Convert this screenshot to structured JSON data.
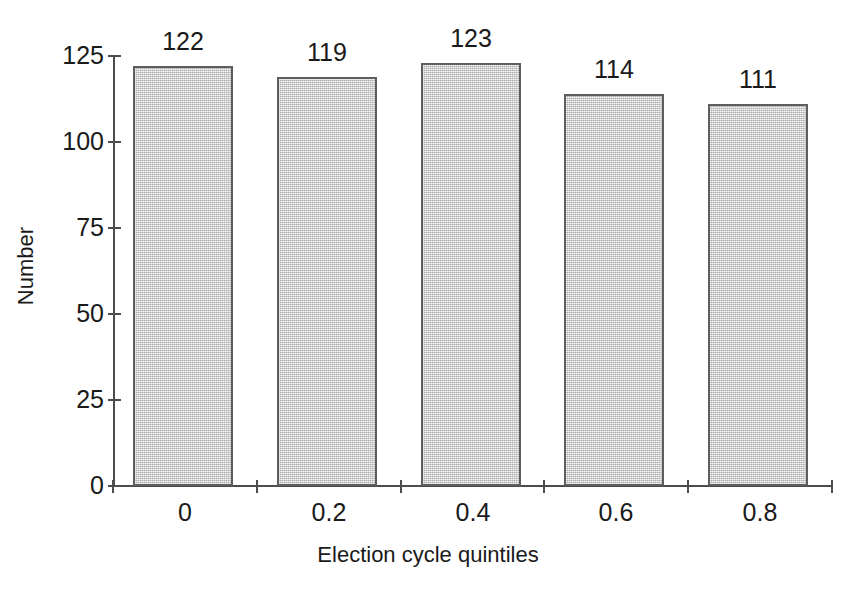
{
  "chart_data": {
    "type": "bar",
    "title": "",
    "subtitle": "",
    "xlabel": "Election cycle quintiles",
    "ylabel": "Number",
    "categories": [
      "0",
      "0.2",
      "0.4",
      "0.6",
      "0.8"
    ],
    "values": [
      122,
      119,
      123,
      114,
      111
    ],
    "data_labels": [
      "122",
      "119",
      "123",
      "114",
      "111"
    ],
    "ylim": [
      0,
      125
    ],
    "y_ticks": [
      0,
      25,
      50,
      75,
      100,
      125
    ],
    "y_tick_labels": [
      "0",
      "25",
      "50",
      "75",
      "100",
      "125"
    ],
    "x_tick_labels": [
      "0",
      "0.2",
      "0.4",
      "0.6",
      "0.8"
    ],
    "grid": false,
    "legend": false,
    "legend_position": "none",
    "bar_fill_color": "#c9c9c9",
    "bar_border_color": "#5e5e5e",
    "axis_color": "#4d4d4d",
    "text_color": "#1a1a1a",
    "background_color": "#ffffff"
  }
}
